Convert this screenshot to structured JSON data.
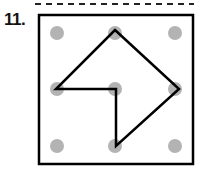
{
  "problem": {
    "number": "11.",
    "grid": {
      "rows": 3,
      "cols": 3,
      "dot_color": "#b3b3b3"
    },
    "shape_vertices": [
      [
        1,
        0
      ],
      [
        2,
        1
      ],
      [
        1,
        2
      ],
      [
        1,
        1
      ],
      [
        0,
        1
      ]
    ],
    "line_color": "#000000"
  }
}
